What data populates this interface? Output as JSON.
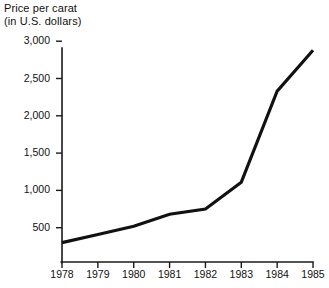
{
  "chart_data": {
    "type": "line",
    "title": "Price per carat (in U.S. dollars)",
    "title_lines": [
      "Price per carat",
      "(in U.S. dollars)"
    ],
    "xlabel": "",
    "ylabel": "Price per carat (in U.S. dollars)",
    "categories": [
      "1978",
      "1979",
      "1980",
      "1981",
      "1982",
      "1983",
      "1984",
      "1985"
    ],
    "x": [
      1978,
      1979,
      1980,
      1981,
      1982,
      1983,
      1984,
      1985
    ],
    "values": [
      300,
      410,
      520,
      680,
      750,
      1110,
      2330,
      2880
    ],
    "series": [
      {
        "name": "Price per carat",
        "values": [
          300,
          410,
          520,
          680,
          750,
          1110,
          2330,
          2880
        ],
        "color": "#111111"
      }
    ],
    "ylim": [
      0,
      3000
    ],
    "xlim": [
      1978,
      1985
    ],
    "yticks": [
      500,
      1000,
      1500,
      2000,
      2500,
      3000
    ],
    "ytick_labels": [
      "500",
      "1,000",
      "1,500",
      "2,000",
      "2,500",
      "3,000"
    ],
    "xticks": [
      1978,
      1979,
      1980,
      1981,
      1982,
      1983,
      1984,
      1985
    ],
    "xtick_labels": [
      "1978",
      "1979",
      "1980",
      "1981",
      "1982",
      "1983",
      "1984",
      "1985"
    ],
    "grid": false,
    "legend": false,
    "legend_position": "none",
    "background_color": "#ffffff",
    "axis_color": "#1a1a1a"
  },
  "geometry": {
    "plot_left": 62,
    "plot_right": 313,
    "plot_top": 48,
    "axis_baseline": 262,
    "y_value_zero_px": 265,
    "px_per_unit": 0.0746,
    "x_step_px": 35.86
  }
}
